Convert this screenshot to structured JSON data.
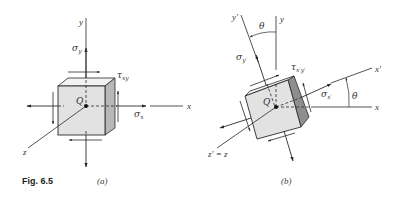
{
  "figure": {
    "label": "Fig. 6.5",
    "panels": [
      {
        "id": "a",
        "caption": "(a)",
        "axes": {
          "x": "x",
          "y": "y",
          "z": "z"
        },
        "point": "Q",
        "stresses": {
          "normal_x": "σx",
          "normal_y": "σy",
          "shear": "τxy"
        },
        "sym": {
          "sigma": "σ",
          "tau": "τ",
          "sub_x": "x",
          "sub_y": "y",
          "sub_xy": "xy"
        }
      },
      {
        "id": "b",
        "caption": "(b)",
        "axes": {
          "x": "x",
          "y": "y",
          "x_prime": "x′",
          "y_prime": "y′",
          "z": "z′ = z"
        },
        "point": "Q",
        "angle": "θ",
        "stresses": {
          "normal_x": "σx′",
          "normal_y": "σy′",
          "shear": "τx′y′"
        },
        "sym": {
          "sigma": "σ",
          "tau": "τ",
          "sub_x": "x′",
          "sub_y": "y′",
          "sub_xy": "x′y′"
        }
      }
    ]
  },
  "colors": {
    "front_face": "#e2e2e2",
    "top_face": "#f2f2f2",
    "side_face_a": "#b8b8b8",
    "side_face_b": "#8e8e8e",
    "line": "#2a2a2a"
  }
}
